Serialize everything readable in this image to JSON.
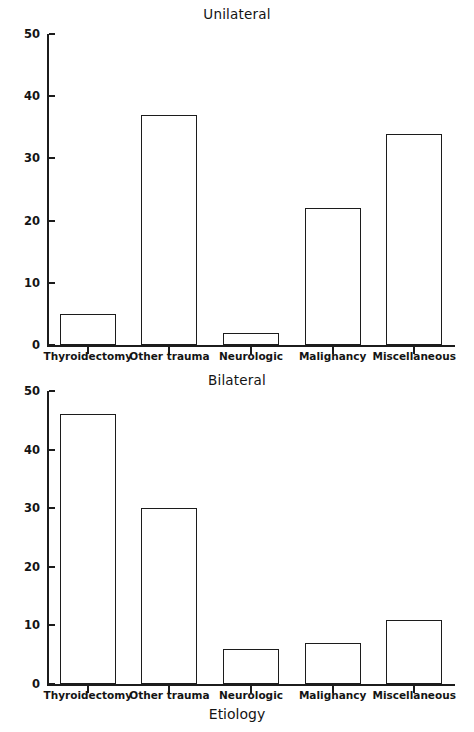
{
  "figure": {
    "background": "#ffffff",
    "ink_color": "#1c1c1c"
  },
  "chart_data": [
    {
      "type": "bar",
      "title": "Unilateral",
      "xlabel": "",
      "ylabel": "percent",
      "categories": [
        "Thyroidectomy",
        "Other trauma",
        "Neurologic",
        "Malignancy",
        "Miscellaneous"
      ],
      "values": [
        5,
        37,
        2,
        22,
        34
      ],
      "ylim": [
        0,
        50
      ],
      "yticks": [
        0,
        10,
        20,
        30,
        40,
        50
      ],
      "ytick_labels": [
        "0",
        "10",
        "20",
        "30",
        "40",
        "50"
      ],
      "grid": false,
      "legend": null,
      "bar_fill": "#ffffff",
      "bar_edge": "#1c1c1c"
    },
    {
      "type": "bar",
      "title": "Bilateral",
      "xlabel": "Etiology",
      "ylabel": "percent",
      "categories": [
        "Thyroidectomy",
        "Other trauma",
        "Neurologic",
        "Malignancy",
        "Miscellaneous"
      ],
      "values": [
        46,
        30,
        6,
        7,
        11
      ],
      "ylim": [
        0,
        50
      ],
      "yticks": [
        0,
        10,
        20,
        30,
        40,
        50
      ],
      "ytick_labels": [
        "0",
        "10",
        "20",
        "30",
        "40",
        "50"
      ],
      "grid": false,
      "legend": null,
      "bar_fill": "#ffffff",
      "bar_edge": "#1c1c1c"
    }
  ]
}
